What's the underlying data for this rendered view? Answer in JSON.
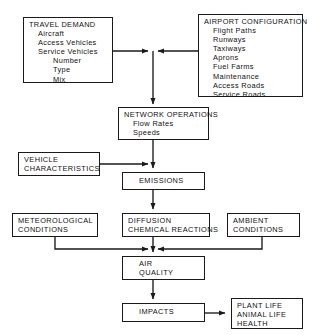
{
  "diagram": {
    "line_color": "#1a1a1a",
    "background": "#ffffff",
    "nodes": [
      {
        "id": "travel-demand",
        "title": "TRAVEL DEMAND",
        "items": [
          "Aircraft",
          "Access Vehicles",
          "Service Vehicles"
        ],
        "subitems": [
          "Number",
          "Type",
          "Mix"
        ]
      },
      {
        "id": "airport-configuration",
        "title": "AIRPORT CONFIGURATION",
        "items": [
          "Flight Paths",
          "Runways",
          "Taxiways",
          "Aprons",
          "Fuel Farms",
          "Maintenance",
          "Access Roads",
          "Service Roads"
        ]
      },
      {
        "id": "network-operations",
        "title": "NETWORK OPERATIONS",
        "items": [
          "Flow Rates",
          "Speeds"
        ]
      },
      {
        "id": "vehicle-characteristics",
        "line1": "VEHICLE",
        "line2": "CHARACTERISTICS"
      },
      {
        "id": "emissions",
        "title": "EMISSIONS"
      },
      {
        "id": "meteorological-conditions",
        "line1": "METEOROLOGICAL",
        "line2": "CONDITIONS"
      },
      {
        "id": "diffusion-chemical-reactions",
        "line1": "DIFFUSION",
        "line2": "CHEMICAL REACTIONS"
      },
      {
        "id": "ambient-conditions",
        "line1": "AMBIENT",
        "line2": "CONDITIONS"
      },
      {
        "id": "air-quality",
        "line1": "AIR",
        "line2": "QUALITY"
      },
      {
        "id": "impacts",
        "title": "IMPACTS"
      },
      {
        "id": "outcomes",
        "line1": "PLANT LIFE",
        "line2": "ANIMAL LIFE",
        "line3": "HEALTH"
      }
    ]
  }
}
